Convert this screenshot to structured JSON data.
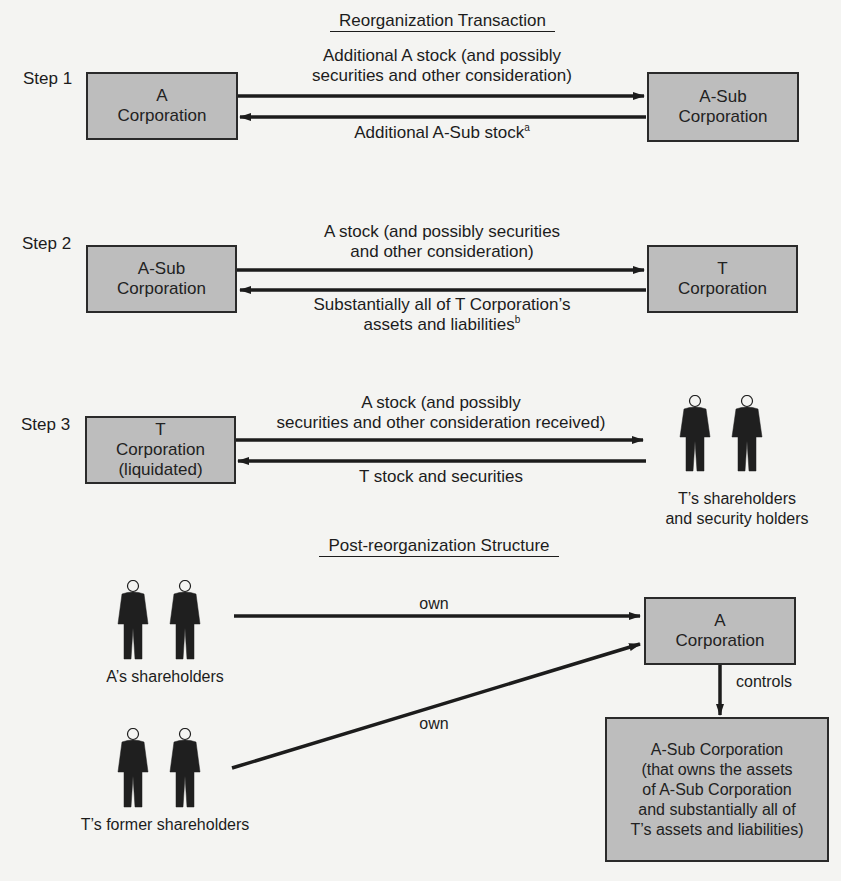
{
  "headings": {
    "reorg": "Reorganization Transaction",
    "post": "Post-reorganization Structure"
  },
  "steps": [
    {
      "label": "Step 1",
      "left_box": {
        "line1": "A",
        "line2": "Corporation"
      },
      "right_box": {
        "line1": "A-Sub",
        "line2": "Corporation"
      },
      "top_arrow": {
        "line1": "Additional A stock (and possibly",
        "line2": "securities and other consideration)"
      },
      "bottom_arrow": {
        "text": "Additional A-Sub stock",
        "footnote": "a"
      }
    },
    {
      "label": "Step 2",
      "left_box": {
        "line1": "A-Sub",
        "line2": "Corporation"
      },
      "right_box": {
        "line1": "T",
        "line2": "Corporation"
      },
      "top_arrow": {
        "line1": "A stock (and possibly securities",
        "line2": "and other consideration)"
      },
      "bottom_arrow": {
        "line1": "Substantially all of T Corporation’s",
        "line2": "assets and liabilities",
        "footnote": "b"
      }
    },
    {
      "label": "Step 3",
      "left_box": {
        "line1": "T",
        "line2": "Corporation",
        "line3": "(liquidated)"
      },
      "right_group": {
        "line1": "T’s shareholders",
        "line2": "and security holders"
      },
      "top_arrow": {
        "line1": "A stock (and possibly",
        "line2": "securities and other consideration received)"
      },
      "bottom_arrow": {
        "text": "T stock and securities"
      }
    }
  ],
  "post": {
    "a_shareholders": "A’s shareholders",
    "t_former_shareholders": "T’s former shareholders",
    "own_top": "own",
    "own_bottom": "own",
    "controls": "controls",
    "a_corp": {
      "line1": "A",
      "line2": "Corporation"
    },
    "a_sub_corp": {
      "line1": "A-Sub Corporation",
      "line2": "(that owns the assets",
      "line3": "of A-Sub Corporation",
      "line4": "and substantially all of",
      "line5": "T’s assets and liabilities)"
    }
  },
  "colors": {
    "box_fill": "#bdbdbd",
    "line": "#1c1c1c",
    "background": "#f4f4f2"
  }
}
